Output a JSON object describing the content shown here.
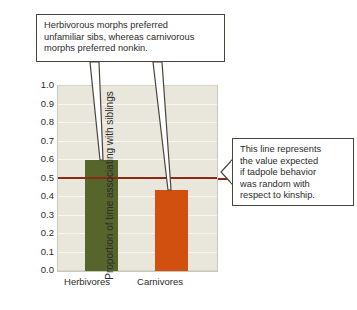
{
  "chart_data": {
    "type": "bar",
    "title": "",
    "xlabel": "",
    "ylabel": "Proportion of time associating with siblings",
    "categories": [
      "Herbivores",
      "Carnivores"
    ],
    "values": [
      0.6,
      0.44
    ],
    "ylim": [
      0.0,
      1.0
    ],
    "ytick_labels": [
      "1.0",
      "0.9",
      "0.8",
      "0.7",
      "0.6",
      "0.5",
      "0.4",
      "0.3",
      "0.2",
      "0.1",
      "0.0"
    ],
    "ytick_values": [
      1.0,
      0.9,
      0.8,
      0.7,
      0.6,
      0.5,
      0.4,
      0.3,
      0.2,
      0.1,
      0.0
    ],
    "grid": true,
    "legend": "none",
    "bar_colors": [
      "#56662b",
      "#d2500f"
    ],
    "reference_line": {
      "value": 0.5,
      "color": "#8b2a16",
      "label": "expected value if behavior random with respect to kinship"
    },
    "annotations": [
      {
        "name": "top-callout",
        "text": "Herbivorous morphs preferred unfamiliar sibs, whereas carnivorous morphs preferred nonkin.",
        "points_to": [
          "Herbivores bar top (0.60)",
          "Carnivores bar top (0.44)"
        ]
      },
      {
        "name": "right-callout",
        "text": "This line represents the value expected if tadpole behavior was random with respect to kinship.",
        "points_to": [
          "reference line at 0.50"
        ]
      }
    ]
  },
  "callouts": {
    "top": {
      "line1": "Herbivorous morphs preferred",
      "line2": "unfamiliar sibs, whereas carnivorous",
      "line3": "morphs preferred nonkin."
    },
    "right": {
      "line1": "This line represents",
      "line2": "the value expected",
      "line3": "if tadpole behavior",
      "line4": "was random with",
      "line5": "respect to kinship."
    }
  },
  "axis": {
    "ylabel": "Proportion of time associating with siblings",
    "yticks": [
      "1.0",
      "0.9",
      "0.8",
      "0.7",
      "0.6",
      "0.5",
      "0.4",
      "0.3",
      "0.2",
      "0.1",
      "0.0"
    ],
    "xticks": [
      "Herbivores",
      "Carnivores"
    ]
  },
  "colors": {
    "herbivore_bar": "#56662b",
    "carnivore_bar": "#d2500f",
    "reference_line": "#8b2a16",
    "plot_background": "#e9e7dc",
    "gridline": "#f7f6f0",
    "callout_border": "#4b443c"
  }
}
